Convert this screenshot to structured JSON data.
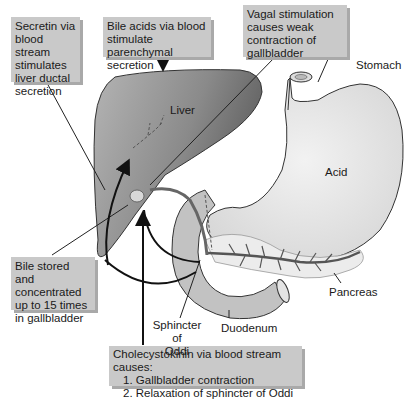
{
  "callouts": {
    "secretin": "Secretin via blood stream stimulates liver ductal secretion",
    "bile_acids": "Bile acids via blood stimulate parenchymal secretion",
    "vagal": "Vagal stimulation causes weak contraction of gallbladder",
    "bile_stored": "Bile stored and concentrated up to 15 times in gallbladder",
    "cck_title": "Cholecystokinin via blood stream causes:",
    "cck_items": [
      "1. Gallbladder contraction",
      "2. Relaxation of sphincter of Oddi"
    ]
  },
  "labels": {
    "liver": "Liver",
    "stomach": "Stomach",
    "acid": "Acid",
    "pancreas": "Pancreas",
    "duodenum": "Duodenum",
    "sphincter_line1": "Sphincter of",
    "sphincter_line2": "Oddi"
  },
  "colors": {
    "liver": "#7d7d7d",
    "stomach": "#e6e6e6",
    "callout_bg": "#c9c9c9"
  }
}
